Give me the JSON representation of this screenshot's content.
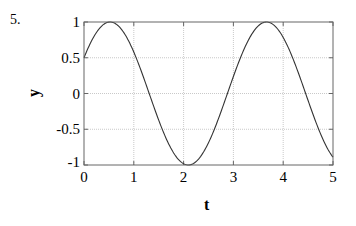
{
  "problem_number": "5.",
  "chart_data": {
    "type": "line",
    "title": "",
    "xlabel": "t",
    "ylabel": "y",
    "xlim": [
      0,
      5
    ],
    "ylim": [
      -1,
      1
    ],
    "xticks": [
      0,
      1,
      2,
      3,
      4,
      5
    ],
    "xtick_labels": [
      "0",
      "1",
      "2",
      "3",
      "4",
      "5"
    ],
    "yticks": [
      1,
      0.5,
      0,
      -0.5,
      -1
    ],
    "ytick_labels": [
      "1",
      "0.5",
      "0",
      "-0.5",
      "-1"
    ],
    "grid": true,
    "legend": null,
    "series": [
      {
        "name": "y",
        "function": "sin(2t + pi/6)",
        "x": [
          0,
          0.25,
          0.5,
          0.52,
          0.75,
          1.0,
          1.25,
          1.5,
          1.75,
          2.0,
          2.09,
          2.25,
          2.5,
          2.75,
          3.0,
          3.25,
          3.5,
          3.67,
          3.75,
          4.0,
          4.25,
          4.5,
          4.75,
          5.0
        ],
        "values": [
          0.5,
          0.86,
          1.0,
          1.0,
          0.9,
          0.58,
          0.11,
          -0.36,
          -0.77,
          -0.98,
          -1.0,
          -0.96,
          -0.68,
          -0.24,
          0.24,
          0.68,
          0.96,
          1.0,
          0.98,
          0.75,
          0.34,
          -0.16,
          -0.61,
          -0.88
        ]
      }
    ],
    "line_color": "#333333",
    "grid_color": "#bbbbbb"
  }
}
